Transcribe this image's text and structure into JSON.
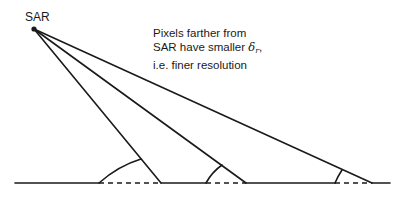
{
  "diagram": {
    "title": "",
    "sensor_label": "SAR",
    "note": {
      "line1": "Pixels farther from",
      "line2_prefix": "SAR have smaller ",
      "line2_symbol": "δ",
      "line2_subscript": "r",
      "line2_suffix": ",",
      "line3": "i.e. finer resolution"
    },
    "colors": {
      "ink": "#1a1a1a",
      "background": "#ffffff"
    },
    "geometry": {
      "sensor_point": [
        34,
        29
      ],
      "ground_y": 183,
      "ground_x_range": [
        15,
        390
      ],
      "rays": [
        {
          "end_x": 161,
          "arc_start_x": 99,
          "arc_end": [
            141,
            159
          ]
        },
        {
          "end_x": 246,
          "arc_start_x": 206,
          "arc_end": [
            222,
            165
          ]
        },
        {
          "end_x": 372,
          "arc_start_x": 335,
          "arc_end": [
            342,
            170
          ]
        }
      ]
    }
  }
}
